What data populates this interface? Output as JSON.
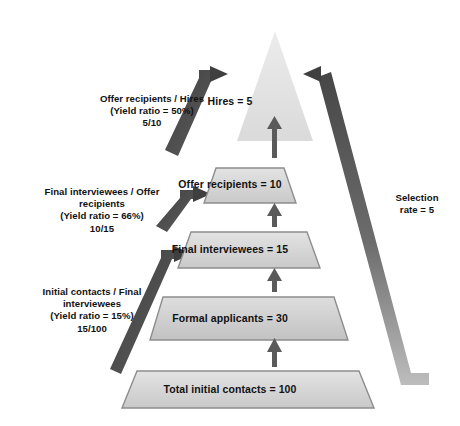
{
  "diagram": {
    "type": "recruitment-funnel-pyramid",
    "levels": [
      {
        "id": "hires",
        "label": "Hires = 5",
        "name": "Hires",
        "value": 5,
        "shape": "triangle"
      },
      {
        "id": "offer-recipients",
        "label": "Offer recipients = 10",
        "name": "Offer recipients",
        "value": 10,
        "shape": "trapezoid"
      },
      {
        "id": "final-interviewees",
        "label": "Final interviewees = 15",
        "name": "Final interviewees",
        "value": 15,
        "shape": "trapezoid"
      },
      {
        "id": "formal-applicants",
        "label": "Formal applicants = 30",
        "name": "Formal applicants",
        "value": 30,
        "shape": "trapezoid"
      },
      {
        "id": "total-contacts",
        "label": "Total initial contacts = 100",
        "name": "Total initial contacts",
        "value": 100,
        "shape": "trapezoid"
      }
    ],
    "yield_notes": [
      {
        "id": "yield-offer-to-hires",
        "line1": "Offer recipients / Hires",
        "line2": "(Yield ratio = 50%)",
        "line3": "5/10",
        "ratio_percent": 50,
        "fraction": "5/10"
      },
      {
        "id": "yield-final-to-offer",
        "line1": "Final interviewees / Offer",
        "line2": "recipients",
        "line3": "(Yield ratio = 66%)",
        "line4": "10/15",
        "ratio_percent": 66,
        "fraction": "10/15"
      },
      {
        "id": "yield-contacts-to-final",
        "line1": "Initial contacts / Final",
        "line2": "interviewees",
        "line3": "(Yield ratio = 15%)",
        "line4": "15/100",
        "ratio_percent": 15,
        "fraction": "15/100"
      }
    ],
    "selection_rate": {
      "id": "selection-rate",
      "line1": "Selection",
      "line2": "rate = 5",
      "value": 5
    },
    "colors": {
      "band_fill_light": "#dcdcdc",
      "band_fill_mid": "#cfcfcf",
      "band_fill_dark": "#c8c8c8",
      "apex_fill": "#e2e2e2",
      "band_stroke": "#8d8d8d",
      "bracket_dark": "#4a4a4a",
      "bracket_light": "#b3b3b3",
      "arrow_color": "#5a5a5a",
      "text_color": "#111111",
      "background": "#ffffff"
    }
  }
}
